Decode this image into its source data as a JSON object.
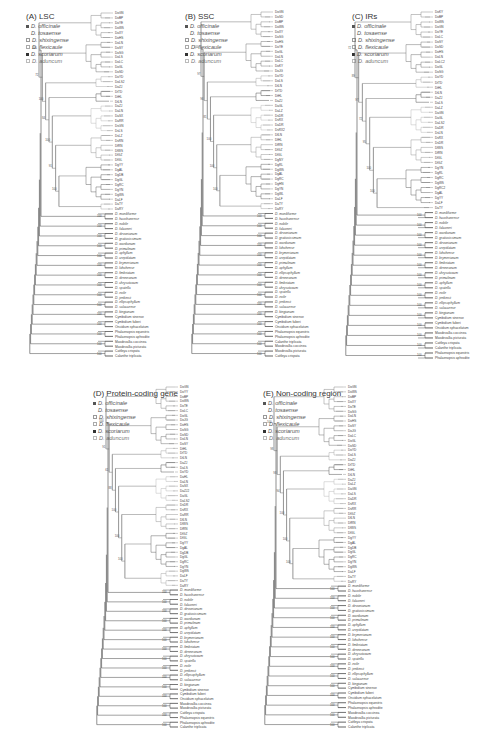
{
  "figure": {
    "legend_species": [
      {
        "label": "D. officinale",
        "marker": "filled-square-small",
        "color": "#555555"
      },
      {
        "label": "D. tosaense",
        "marker": "none",
        "color": "#777777"
      },
      {
        "label": "D. shixingense",
        "marker": "open-square",
        "color": "#999999"
      },
      {
        "label": "D. flexicaule",
        "marker": "open-square",
        "color": "#aaaaaa"
      },
      {
        "label": "D. scoriarum",
        "marker": "filled-square",
        "color": "#333333"
      },
      {
        "label": "D. aduncum",
        "marker": "open-square",
        "color": "#bbbbbb"
      }
    ],
    "panels": [
      {
        "id": "A",
        "title": "(A) LSC",
        "officinale_leaves": [
          "DoGN",
          "DoBP",
          "DoYE",
          "DoWS",
          "DoXY",
          "DoHS",
          "DoLN",
          "DoSY",
          "DoSG",
          "DoLS",
          "DoLC",
          "DoGL",
          "DoSD",
          "DoYD",
          "DoLS2",
          "DoZJ",
          "DtTD",
          "DtHL",
          "DtLN",
          "DaZJ",
          "DaLN",
          "DaSX",
          "DaRR",
          "DsGN",
          "DsLS",
          "DsLZ",
          "DsRN",
          "DfRN",
          "DfWS",
          "DfGZ",
          "DfGL",
          "DgYY",
          "DgAL",
          "DgDB",
          "DgGL",
          "DgRC",
          "DgYN",
          "DgWS",
          "DaLF",
          "DaTY",
          "DaRY"
        ],
        "outgroup_leaves": [
          "D. moniliforme",
          "D. huoshanense",
          "D. nobile",
          "D. falconeri",
          "D. devonianum",
          "D. gratiosissimum",
          "D. wardianum",
          "D. primulinum",
          "D. aphyllum",
          "D. crepidatum",
          "D. brymerianum",
          "D. lohohense",
          "D. fimbriatum",
          "D. denneanum",
          "D. chrysotoxum",
          "D. spatella",
          "D. exile",
          "D. jenkinsii",
          "D. ellipsophyllum",
          "D. salaccense",
          "D. kingianum",
          "Cymbidium sinense",
          "Cymbidium faberi",
          "Oncidium sphacelatum",
          "Phalaenopsis equestris",
          "Phalaenopsis aphrodite",
          "Masdevallia coccinea",
          "Masdevallia picturata",
          "Cattleya crispata",
          "Calanthe triplicata"
        ],
        "support_values": [
          "100",
          "72",
          "100",
          "84",
          "100",
          "91",
          "100",
          "100",
          "100",
          "100",
          "100",
          "100",
          "100",
          "100",
          "100",
          "100",
          "100"
        ]
      },
      {
        "id": "B",
        "title": "(B) SSC",
        "officinale_leaves": [
          "DoGN",
          "DoSD",
          "DoBP",
          "DoWS",
          "DoXY",
          "DoSG",
          "DoHS",
          "DoYE",
          "DoGL",
          "DoLN",
          "DoLC",
          "DoKY",
          "DoJG",
          "DoYD",
          "DoLS",
          "DtLN",
          "DtTD",
          "DtHL",
          "DaZJ",
          "DaGL",
          "DaLZ",
          "DsDR",
          "DsRX",
          "DaDR",
          "DsRX2",
          "DfLN",
          "DfHL",
          "DfRN",
          "DfGZ",
          "DfGL",
          "DgNY",
          "DgRL",
          "DgWS",
          "DgAL",
          "DgRC",
          "DgHN",
          "DgYN",
          "DgWL",
          "DaLF",
          "DaTY",
          "DaRY"
        ],
        "outgroup_leaves": [
          "D. moniliforme",
          "D. huoshanense",
          "D. nobile",
          "D. falconeri",
          "D. devonianum",
          "D. gratiosissimum",
          "D. wardianum",
          "D. lohohense",
          "D. brymerianum",
          "D. crepidatum",
          "D. primulinum",
          "D. aphyllum",
          "D. ellipsophyllum",
          "D. denneanum",
          "D. fimbriatum",
          "D. chrysotoxum",
          "D. spatella",
          "D. exile",
          "D. jenkinsii",
          "D. salaccense",
          "D. kingianum",
          "Cymbidium sinense",
          "Cymbidium faberi",
          "Oncidium sphacelatum",
          "Phalaenopsis equestris",
          "Phalaenopsis aphrodite",
          "Calanthe triplicata",
          "Masdevallia coccinea",
          "Masdevallia picturata",
          "Cattleya crispata"
        ],
        "support_values": [
          "100",
          "97",
          "96",
          "81",
          "100",
          "100",
          "100",
          "100",
          "100",
          "100",
          "100",
          "100",
          "100",
          "100",
          "100"
        ]
      },
      {
        "id": "C",
        "title": "(C) IRs",
        "officinale_leaves": [
          "DoKY",
          "DoBP",
          "DoWS",
          "DoGN",
          "DoYE",
          "DoLC",
          "DoSY",
          "DoSD",
          "DoHS",
          "DoLN",
          "DoLC2",
          "DoGL",
          "DoSG",
          "DoYD",
          "DtTD",
          "DtHL",
          "DtLN",
          "DaZJ",
          "DaLS",
          "DaLZ",
          "DaGN",
          "DaGL",
          "DaLS2",
          "DaDR",
          "DsLN",
          "DsRX",
          "DsDR",
          "DfWS",
          "DfRN",
          "DfGL",
          "DfGZ",
          "DgYN",
          "DgRL",
          "DgRC",
          "DgWS",
          "DgRC2",
          "DgAL",
          "DgYY",
          "DaLF",
          "DaTY"
        ],
        "outgroup_leaves": [
          "D. moniliforme",
          "D. huoshanense",
          "D. nobile",
          "D. falconeri",
          "D. wardianum",
          "D. gratiosissimum",
          "D. devonianum",
          "D. crepidatum",
          "D. lohohense",
          "D. brymerianum",
          "D. fimbriatum",
          "D. denneanum",
          "D. chrysotoxum",
          "D. primulinum",
          "D. aphyllum",
          "D. spatella",
          "D. exile",
          "D. jenkinsii",
          "D. ellipsophyllum",
          "D. salaccense",
          "D. kingianum",
          "Cymbidium sinense",
          "Cymbidium faberi",
          "Oncidium sphacelatum",
          "Masdevallia coccinea",
          "Masdevallia picturata",
          "Cattleya crispata",
          "Calanthe triplicata",
          "Phalaenopsis equestris",
          "Phalaenopsis aphrodite"
        ],
        "support_values": [
          "72",
          "89",
          "97",
          "72",
          "95",
          "100",
          "100",
          "100",
          "100",
          "100",
          "100",
          "100",
          "100",
          "100"
        ]
      },
      {
        "id": "D",
        "title": "(D) Protein-coding gene",
        "officinale_leaves": [
          "DoGN",
          "DoYY",
          "DoBP",
          "DoWS",
          "DoTE",
          "DoLC",
          "DoGL",
          "DoJG",
          "DoHS",
          "DoSG",
          "DoSD",
          "DoLN",
          "DoSY",
          "DtHL",
          "DtTD",
          "DtLN",
          "DaZJ",
          "DaLS",
          "DoYD",
          "DaHL",
          "DaLN",
          "DaSX",
          "DaZJ2",
          "DaGL",
          "DaLS2",
          "DsDR",
          "DsRX",
          "DaRR",
          "DfLN",
          "DfWS",
          "DfRN",
          "DfGZ",
          "DfGL",
          "DgYY",
          "DgAL",
          "DgDB",
          "DgGL",
          "DgRC",
          "DgYN",
          "DgWS",
          "DaLF",
          "DaTY",
          "DaRY"
        ],
        "outgroup_leaves": [
          "D. moniliforme",
          "D. huoshanense",
          "D. nobile",
          "D. falconeri",
          "D. devonianum",
          "D. gratiosissimum",
          "D. wardianum",
          "D. primulinum",
          "D. aphyllum",
          "D. crepidatum",
          "D. brymerianum",
          "D. lohohense",
          "D. fimbriatum",
          "D. denneanum",
          "D. chrysotoxum",
          "D. spatella",
          "D. exile",
          "D. jenkinsii",
          "D. ellipsophyllum",
          "D. salaccense",
          "D. kingianum",
          "Cymbidium sinense",
          "Cymbidium faberi",
          "Oncidium sphacelatum",
          "Masdevallia coccinea",
          "Masdevallia picturata",
          "Cattleya crispata",
          "Phalaenopsis equestris",
          "Phalaenopsis aphrodite",
          "Calanthe triplicata"
        ],
        "support_values": [
          "100",
          "91",
          "61",
          "88",
          "100",
          "100",
          "100",
          "100",
          "100",
          "100",
          "100",
          "100",
          "100",
          "100",
          "100",
          "100",
          "100"
        ]
      },
      {
        "id": "E",
        "title": "(E) Non-coding region",
        "officinale_leaves": [
          "DoGN",
          "DoWS",
          "DoBP",
          "DoXY",
          "DoTE",
          "DoSG",
          "DoLN",
          "DoHS",
          "DoSY",
          "DoJG",
          "DoLC",
          "DoGL",
          "DoSD",
          "DoYD",
          "DoLS",
          "DoZJ",
          "DtTD",
          "DtHL",
          "DtLN",
          "DaZJ",
          "DaLZ",
          "DaGN",
          "DaLS",
          "DaDR",
          "DsRX",
          "DsRR",
          "DfGZ",
          "DfLN",
          "DfRN",
          "DfWS",
          "DfGL",
          "DgYY",
          "DgAL",
          "DgDB",
          "DgGL",
          "DgRC",
          "DgYN",
          "DgWS",
          "DaLF",
          "DaTY",
          "DaRY"
        ],
        "outgroup_leaves": [
          "D. moniliforme",
          "D. huoshanense",
          "D. nobile",
          "D. falconeri",
          "D. devonianum",
          "D. gratiosissimum",
          "D. wardianum",
          "D. primulinum",
          "D. aphyllum",
          "D. crepidatum",
          "D. brymerianum",
          "D. lohohense",
          "D. fimbriatum",
          "D. denneanum",
          "D. chrysotoxum",
          "D. spatella",
          "D. exile",
          "D. jenkinsii",
          "D. ellipsophyllum",
          "D. salaccense",
          "D. kingianum",
          "Cymbidium sinense",
          "Cymbidium faberi",
          "Oncidium sphacelatum",
          "Phalaenopsis equestris",
          "Phalaenopsis aphrodite",
          "Masdevallia coccinea",
          "Masdevallia picturata",
          "Cattleya crispata",
          "Calanthe triplicata"
        ],
        "support_values": [
          "100",
          "98",
          "93",
          "94",
          "100",
          "100",
          "100",
          "100",
          "100",
          "100",
          "100",
          "100",
          "100",
          "100",
          "100"
        ]
      }
    ]
  }
}
